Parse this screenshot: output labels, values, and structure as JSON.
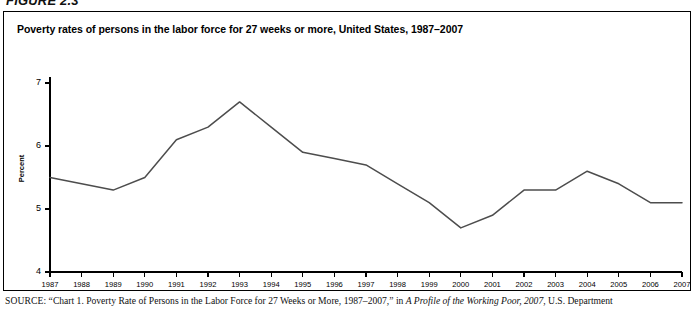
{
  "figure": {
    "label": "FIGURE 2.3",
    "title": "Poverty rates of persons in the labor force for 27 weeks or more, United States, 1987–2007"
  },
  "source": {
    "prefix": "SOURCE:",
    "text_before_italic": " “Chart 1. Poverty Rate of Persons in the Labor Force for 27 Weeks or More, 1987–2007,” in ",
    "italic_title": "A Profile of the Working Poor, 2007",
    "text_after_italic": ", U.S. Department"
  },
  "colors": {
    "line": "#4d4d4d",
    "axis": "#000000",
    "border": "#000000",
    "background": "#ffffff"
  },
  "chart_data": {
    "type": "line",
    "title": "Poverty rates of persons in the labor force for 27 weeks or more, United States, 1987–2007",
    "xlabel": "",
    "ylabel": "Percent",
    "ylim": [
      4,
      7
    ],
    "yticks": [
      4,
      5,
      6,
      7
    ],
    "ytick_labels": [
      "4",
      "5",
      "6",
      "7"
    ],
    "grid": false,
    "legend": null,
    "categories": [
      "1987",
      "1988",
      "1989",
      "1990",
      "1991",
      "1992",
      "1993",
      "1994",
      "1995",
      "1996",
      "1997",
      "1998",
      "1999",
      "2000",
      "2001",
      "2002",
      "2003",
      "2004",
      "2005",
      "2006",
      "2007"
    ],
    "values": [
      5.5,
      5.4,
      5.3,
      5.5,
      6.1,
      6.3,
      6.7,
      6.3,
      5.9,
      5.8,
      5.7,
      5.4,
      5.1,
      4.7,
      4.9,
      5.3,
      5.3,
      5.6,
      5.4,
      5.1,
      5.1
    ],
    "series": [
      {
        "name": "Poverty rate (percent)",
        "values": [
          5.5,
          5.4,
          5.3,
          5.5,
          6.1,
          6.3,
          6.7,
          6.3,
          5.9,
          5.8,
          5.7,
          5.4,
          5.1,
          4.7,
          4.9,
          5.3,
          5.3,
          5.6,
          5.4,
          5.1,
          5.1
        ]
      }
    ]
  }
}
